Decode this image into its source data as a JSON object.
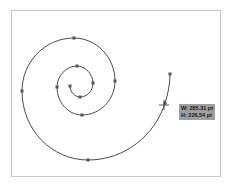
{
  "canvas": {
    "artboard_border_color": "#c8c8c8",
    "path_color": "#4a4a4a",
    "anchor_color": "#555555"
  },
  "tooltip": {
    "width_label": "W: 285.31 pt",
    "height_label": "H: 226.54 pt",
    "background": "#9e9e9e"
  },
  "spiral": {
    "anchors": [
      [
        70,
        86
      ],
      [
        80,
        97
      ],
      [
        93,
        83
      ],
      [
        77,
        66
      ],
      [
        57,
        87
      ],
      [
        82,
        115
      ],
      [
        115,
        81
      ],
      [
        74,
        38
      ],
      [
        22,
        91
      ],
      [
        88,
        160
      ],
      [
        165,
        103
      ],
      [
        170,
        74
      ]
    ]
  }
}
